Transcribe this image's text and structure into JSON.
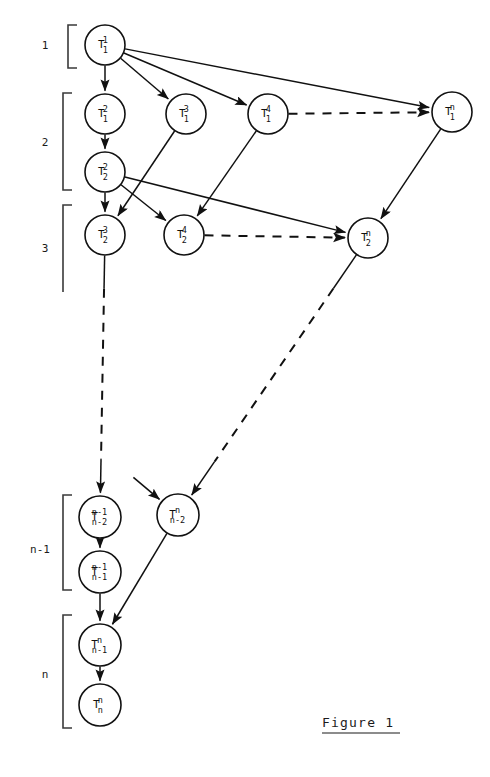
{
  "figure": {
    "caption": "Figure 1",
    "caption_underlined": true,
    "background_color": "#ffffff",
    "ink_color": "#111111"
  },
  "row_labels": [
    {
      "text": "1",
      "x": 45,
      "y": 49
    },
    {
      "text": "2",
      "x": 45,
      "y": 146
    },
    {
      "text": "3",
      "x": 45,
      "y": 252
    },
    {
      "text": "n-1",
      "x": 40,
      "y": 553
    },
    {
      "text": "n",
      "x": 45,
      "y": 678
    }
  ],
  "brackets": [
    {
      "name": "bracket-row-1",
      "x": 68,
      "top": 25,
      "bottom": 68,
      "tick": 9,
      "open_bottom": false
    },
    {
      "name": "bracket-row-2",
      "x": 63,
      "top": 93,
      "bottom": 190,
      "tick": 9,
      "open_bottom": false
    },
    {
      "name": "bracket-row-3",
      "x": 63,
      "top": 205,
      "bottom": 292,
      "tick": 9,
      "open_bottom": true
    },
    {
      "name": "bracket-row-n-1",
      "x": 63,
      "top": 495,
      "bottom": 590,
      "tick": 9,
      "open_bottom": false
    },
    {
      "name": "bracket-row-n",
      "x": 63,
      "top": 615,
      "bottom": 728,
      "tick": 9,
      "open_bottom": false
    }
  ],
  "nodes": [
    {
      "id": "T_1^1",
      "base": "T",
      "sup": "1",
      "sub": "1",
      "cx": 105,
      "cy": 45,
      "r": 20
    },
    {
      "id": "T_1^2",
      "base": "T",
      "sup": "2",
      "sub": "1",
      "cx": 105,
      "cy": 114,
      "r": 20
    },
    {
      "id": "T_1^3",
      "base": "T",
      "sup": "3",
      "sub": "1",
      "cx": 186,
      "cy": 114,
      "r": 20
    },
    {
      "id": "T_1^4",
      "base": "T",
      "sup": "4",
      "sub": "1",
      "cx": 268,
      "cy": 114,
      "r": 20
    },
    {
      "id": "T_1^n",
      "base": "T",
      "sup": "n",
      "sub": "1",
      "cx": 452,
      "cy": 112,
      "r": 20
    },
    {
      "id": "T_2^2",
      "base": "T",
      "sup": "2",
      "sub": "2",
      "cx": 105,
      "cy": 172,
      "r": 20
    },
    {
      "id": "T_2^3",
      "base": "T",
      "sup": "3",
      "sub": "2",
      "cx": 105,
      "cy": 235,
      "r": 20
    },
    {
      "id": "T_2^4",
      "base": "T",
      "sup": "4",
      "sub": "2",
      "cx": 184,
      "cy": 235,
      "r": 20
    },
    {
      "id": "T_2^n",
      "base": "T",
      "sup": "n",
      "sub": "2",
      "cx": 368,
      "cy": 238,
      "r": 20
    },
    {
      "id": "T_n-2^n-1",
      "base": "T",
      "sup": "n-1",
      "sub": "n-2",
      "cx": 100,
      "cy": 517,
      "r": 21
    },
    {
      "id": "T_n-2^n",
      "base": "T",
      "sup": "n",
      "sub": "n-2",
      "cx": 178,
      "cy": 515,
      "r": 21
    },
    {
      "id": "T_n-1^n-1",
      "base": "T",
      "sup": "n-1",
      "sub": "n-1",
      "cx": 100,
      "cy": 572,
      "r": 21
    },
    {
      "id": "T_n-1^n",
      "base": "T",
      "sup": "n",
      "sub": "n-1",
      "cx": 100,
      "cy": 645,
      "r": 21
    },
    {
      "id": "T_n^n",
      "base": "T",
      "sup": "n",
      "sub": "n",
      "cx": 100,
      "cy": 705,
      "r": 21
    }
  ],
  "edges": [
    {
      "name": "edge-T11-to-T12",
      "from": "T_1^1",
      "to": "T_1^2",
      "style": "solid",
      "arrow": true
    },
    {
      "name": "edge-T11-to-T13",
      "from": "T_1^1",
      "to": "T_1^3",
      "style": "solid",
      "arrow": true
    },
    {
      "name": "edge-T11-to-T14",
      "from": "T_1^1",
      "to": "T_1^4",
      "style": "solid",
      "arrow": true
    },
    {
      "name": "edge-T11-to-T1n",
      "from": "T_1^1",
      "to": "T_1^n",
      "style": "solid",
      "arrow": true
    },
    {
      "name": "edge-T14-to-T1n-dashed",
      "from": "T_1^4",
      "to": "T_1^n",
      "style": "dashed",
      "arrow": true
    },
    {
      "name": "edge-T12-to-T22",
      "from": "T_1^2",
      "to": "T_2^2",
      "style": "solid",
      "arrow": true
    },
    {
      "name": "edge-T13-to-T23",
      "from": "T_1^3",
      "to": "T_2^3",
      "style": "solid",
      "arrow": true
    },
    {
      "name": "edge-T14-to-T24",
      "from": "T_1^4",
      "to": "T_2^4",
      "style": "solid",
      "arrow": true
    },
    {
      "name": "edge-T22-to-T23",
      "from": "T_2^2",
      "to": "T_2^3",
      "style": "solid",
      "arrow": true
    },
    {
      "name": "edge-T22-to-T24",
      "from": "T_2^2",
      "to": "T_2^4",
      "style": "solid",
      "arrow": true
    },
    {
      "name": "edge-T22-to-T2n",
      "from": "T_2^2",
      "to": "T_2^n",
      "style": "solid",
      "arrow": true
    },
    {
      "name": "edge-T1n-to-T2n",
      "from": "T_1^n",
      "to": "T_2^n",
      "style": "solid",
      "arrow": true
    },
    {
      "name": "edge-T24-to-T2n-dashed",
      "from": "T_2^4",
      "to": "T_2^n",
      "style": "dashed",
      "arrow": true
    },
    {
      "name": "edge-T23-to-Tn-2n-1",
      "from": "T_2^3",
      "to": "T_n-2^n-1",
      "style": "dashed-mid",
      "arrow": true
    },
    {
      "name": "edge-T2n-to-Tn-2n",
      "from": "T_2^n",
      "to": "T_n-2^n",
      "style": "dashed-mid",
      "arrow": true
    },
    {
      "name": "edge-Tn-2n-1-to-Tn-1n-1",
      "from": "T_n-2^n-1",
      "to": "T_n-1^n-1",
      "style": "solid",
      "arrow": true
    },
    {
      "name": "edge-Tn-1n-1-to-Tn-1n",
      "from": "T_n-1^n-1",
      "to": "T_n-1^n",
      "style": "solid",
      "arrow": true
    },
    {
      "name": "edge-Tn-2n-to-Tn-1n",
      "from": "T_n-2^n",
      "to": "T_n-1^n",
      "style": "solid",
      "arrow": true
    },
    {
      "name": "edge-Tn-1n-to-Tnn",
      "from": "T_n-1^n",
      "to": "T_n^n",
      "style": "solid",
      "arrow": true
    },
    {
      "name": "edge-incoming-stub-to-Tn-2n",
      "from": "free:133,477",
      "to": "T_n-2^n",
      "style": "solid",
      "arrow": true
    }
  ],
  "caption_position": {
    "x": 322,
    "y": 727,
    "rule_y": 733,
    "rule_width": 78
  }
}
